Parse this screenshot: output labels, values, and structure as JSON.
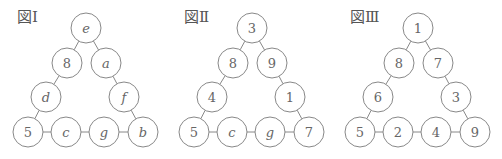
{
  "colors": {
    "stroke": "#888888",
    "text": "#666666",
    "background": "#ffffff"
  },
  "figures": [
    {
      "label": "図Ⅰ",
      "label_pos": [
        17,
        10
      ],
      "offset_x": 0,
      "nodes": [
        "e",
        "8",
        "a",
        "d",
        "f",
        "5",
        "c",
        "g",
        "b"
      ]
    },
    {
      "label": "図Ⅱ",
      "label_pos": [
        184,
        10
      ],
      "offset_x": 166,
      "nodes": [
        "3",
        "8",
        "9",
        "4",
        "1",
        "5",
        "c",
        "g",
        "7"
      ]
    },
    {
      "label": "図Ⅲ",
      "label_pos": [
        350,
        10
      ],
      "offset_x": 332,
      "nodes": [
        "1",
        "8",
        "7",
        "6",
        "3",
        "5",
        "2",
        "4",
        "9"
      ]
    }
  ],
  "layout": {
    "radius": 15,
    "positions": [
      [
        86,
        28
      ],
      [
        67,
        63
      ],
      [
        106,
        63
      ],
      [
        46,
        97
      ],
      [
        124,
        97
      ],
      [
        28,
        132
      ],
      [
        66,
        132
      ],
      [
        104,
        132
      ],
      [
        143,
        132
      ]
    ],
    "edges": [
      [
        0,
        1
      ],
      [
        0,
        2
      ],
      [
        1,
        3
      ],
      [
        2,
        4
      ],
      [
        3,
        5
      ],
      [
        4,
        8
      ],
      [
        5,
        6
      ],
      [
        6,
        7
      ],
      [
        7,
        8
      ]
    ]
  }
}
